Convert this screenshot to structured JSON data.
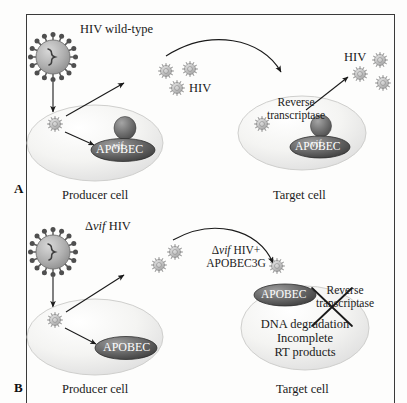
{
  "figure": {
    "domain": "biology-diagram"
  },
  "panels": [
    {
      "letter": "A",
      "condition": "HIV wild-type",
      "virus_label": "HIV wild-type",
      "producer_cell_label": "Producer cell",
      "target_cell_label": "Target cell",
      "released_virus_label": "HIV",
      "target_virus_label": "HIV",
      "enzyme_label_line1": "Reverse",
      "enzyme_label_line2": "transcriptase",
      "enzyme_blocked": false,
      "producer_proteins": [
        "vif",
        "APOBEC"
      ],
      "target_proteins": [
        "vif",
        "APOBEC"
      ],
      "vif_label": "vif",
      "apobec_label": "APOBEC"
    },
    {
      "letter": "B",
      "condition": "Delta-vif HIV",
      "virus_label_delta": "Δ",
      "virus_label_italic": "vif",
      "virus_label_rest": " HIV",
      "producer_cell_label": "Producer cell",
      "target_cell_label": "Target cell",
      "released_label_delta": "Δ",
      "released_label_italic": "vif",
      "released_label_rest": " HIV+",
      "released_label_line2": "APOBEC3G",
      "enzyme_label_line1": "Reverse",
      "enzyme_label_line2": "transcriptase",
      "enzyme_blocked": true,
      "outcome_line1": "DNA degradation",
      "outcome_line2": "Incomplete",
      "outcome_line3": "RT products",
      "producer_proteins": [
        "APOBEC"
      ],
      "target_proteins": [
        "APOBEC"
      ],
      "apobec_label": "APOBEC"
    }
  ],
  "colors": {
    "frame_border": "#3a3a3a",
    "cell_fill_light": "#fbfbfa",
    "cell_fill_mid": "#e8e8e6",
    "cell_edge": "#c9c9c6",
    "apobec_dark": "#4a4a4a",
    "apobec_light": "#8a8a8a",
    "vif_dark": "#5c5c5c",
    "virion_gray": "#9a9a9a",
    "arrow": "#1a1a1a",
    "text": "#1a1a1a",
    "background": "#fdfdfc"
  },
  "icons": {
    "virion": "hiv-virion-icon",
    "cell": "cell-ellipse-icon",
    "arrow": "arrow-icon",
    "arc_arrow": "curved-arrow-icon",
    "cross_out": "cross-out-x-icon"
  }
}
